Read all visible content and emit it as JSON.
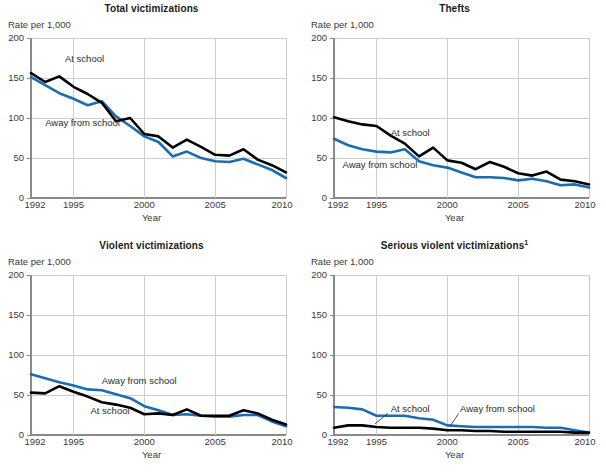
{
  "figure": {
    "axis_unit_label": "Rate per 1,000",
    "x_axis_label": "Year",
    "y_ticks": [
      "0",
      "50",
      "100",
      "150",
      "200"
    ],
    "x_ticks": [
      "1992",
      "1995",
      "2000",
      "2005",
      "2010"
    ],
    "series_label_at_school": "At school",
    "series_label_away": "Away from school",
    "colors": {
      "at_school": "#000000",
      "away_from_school": "#1b6cb0",
      "gridline": "#c9c9c9",
      "axis": "#8a8a8a",
      "text": "#3a3a3a"
    }
  },
  "chart_data": [
    {
      "type": "line",
      "title": "Total victimizations",
      "title_superscript": "",
      "xlabel": "Year",
      "ylabel": "Rate per 1,000",
      "xlim": [
        1992,
        2010
      ],
      "ylim": [
        0,
        200
      ],
      "yticks": [
        0,
        50,
        100,
        150,
        200
      ],
      "xticks": [
        1992,
        1995,
        2000,
        2005,
        2010
      ],
      "grid": true,
      "legend": "inline-labels",
      "x": [
        1992,
        1993,
        1994,
        1995,
        1996,
        1997,
        1998,
        1999,
        2000,
        2001,
        2002,
        2003,
        2004,
        2005,
        2006,
        2007,
        2008,
        2009,
        2010
      ],
      "series": [
        {
          "name": "At school",
          "color": "#000000",
          "values": [
            156,
            145,
            152,
            139,
            130,
            119,
            96,
            100,
            80,
            77,
            63,
            73,
            64,
            54,
            53,
            61,
            48,
            41,
            32
          ]
        },
        {
          "name": "Away from school",
          "color": "#1b6cb0",
          "values": [
            151,
            141,
            131,
            124,
            116,
            121,
            102,
            90,
            77,
            70,
            52,
            58,
            50,
            46,
            45,
            49,
            42,
            35,
            25
          ]
        }
      ],
      "labels": [
        {
          "text": "At school",
          "x": 1994.4,
          "y": 172
        },
        {
          "text": "Away from school",
          "x": 1993.0,
          "y": 93
        }
      ]
    },
    {
      "type": "line",
      "title": "Thefts",
      "title_superscript": "",
      "xlabel": "Year",
      "ylabel": "Rate per 1,000",
      "xlim": [
        1992,
        2010
      ],
      "ylim": [
        0,
        200
      ],
      "yticks": [
        0,
        50,
        100,
        150,
        200
      ],
      "xticks": [
        1992,
        1995,
        2000,
        2005,
        2010
      ],
      "grid": true,
      "legend": "inline-labels",
      "x": [
        1992,
        1993,
        1994,
        1995,
        1996,
        1997,
        1998,
        1999,
        2000,
        2001,
        2002,
        2003,
        2004,
        2005,
        2006,
        2007,
        2008,
        2009,
        2010
      ],
      "series": [
        {
          "name": "At school",
          "color": "#000000",
          "values": [
            101,
            96,
            92,
            90,
            78,
            68,
            52,
            63,
            47,
            44,
            36,
            45,
            39,
            31,
            28,
            33,
            23,
            21,
            17
          ]
        },
        {
          "name": "Away from school",
          "color": "#1b6cb0",
          "values": [
            74,
            66,
            61,
            58,
            57,
            61,
            46,
            41,
            38,
            32,
            26,
            26,
            25,
            22,
            24,
            21,
            16,
            17,
            13
          ]
        }
      ],
      "labels": [
        {
          "text": "At school",
          "x": 1996.0,
          "y": 80
        },
        {
          "text": "Away from school",
          "x": 1992.6,
          "y": 40
        }
      ]
    },
    {
      "type": "line",
      "title": "Violent victimizations",
      "title_superscript": "",
      "xlabel": "Year",
      "ylabel": "Rate per 1,000",
      "xlim": [
        1992,
        2010
      ],
      "ylim": [
        0,
        200
      ],
      "yticks": [
        0,
        50,
        100,
        150,
        200
      ],
      "xticks": [
        1992,
        1995,
        2000,
        2005,
        2010
      ],
      "grid": true,
      "legend": "inline-labels",
      "x": [
        1992,
        1993,
        1994,
        1995,
        1996,
        1997,
        1998,
        1999,
        2000,
        2001,
        2002,
        2003,
        2004,
        2005,
        2006,
        2007,
        2008,
        2009,
        2010
      ],
      "series": [
        {
          "name": "At school",
          "color": "#000000",
          "values": [
            53,
            52,
            61,
            54,
            48,
            41,
            38,
            34,
            26,
            27,
            25,
            32,
            24,
            24,
            24,
            31,
            27,
            19,
            13
          ]
        },
        {
          "name": "Away from school",
          "color": "#1b6cb0",
          "values": [
            76,
            71,
            66,
            62,
            57,
            56,
            51,
            46,
            36,
            31,
            25,
            26,
            24,
            23,
            23,
            25,
            25,
            17,
            11
          ]
        }
      ],
      "labels": [
        {
          "text": "Away from school",
          "x": 1997.0,
          "y": 66
        },
        {
          "text": "At school",
          "x": 1996.2,
          "y": 29
        }
      ]
    },
    {
      "type": "line",
      "title": "Serious violent victimizations",
      "title_superscript": "1",
      "xlabel": "Year",
      "ylabel": "Rate per 1,000",
      "xlim": [
        1992,
        2010
      ],
      "ylim": [
        0,
        200
      ],
      "yticks": [
        0,
        50,
        100,
        150,
        200
      ],
      "xticks": [
        1992,
        1995,
        2000,
        2005,
        2010
      ],
      "grid": true,
      "legend": "inline-labels",
      "x": [
        1992,
        1993,
        1994,
        1995,
        1996,
        1997,
        1998,
        1999,
        2000,
        2001,
        2002,
        2003,
        2004,
        2005,
        2006,
        2007,
        2008,
        2009,
        2010
      ],
      "series": [
        {
          "name": "At school",
          "color": "#000000",
          "values": [
            9,
            12,
            12,
            10,
            9,
            9,
            9,
            8,
            6,
            6,
            5,
            5,
            4,
            4,
            4,
            4,
            4,
            3,
            3
          ]
        },
        {
          "name": "Away from school",
          "color": "#1b6cb0",
          "values": [
            35,
            34,
            32,
            24,
            24,
            24,
            21,
            19,
            12,
            11,
            10,
            10,
            10,
            10,
            10,
            9,
            9,
            6,
            3
          ]
        }
      ],
      "labels": [
        {
          "text": "At school",
          "x": 1996.0,
          "y": 31
        },
        {
          "text": "Away from school",
          "x": 2000.9,
          "y": 31
        }
      ],
      "leader_lines": [
        {
          "from_label": "At school",
          "x1": 1995.8,
          "y1": 27,
          "x2": 1994.9,
          "y2": 14
        },
        {
          "from_label": "Away from school",
          "x1": 2000.8,
          "y1": 27,
          "x2": 2000.2,
          "y2": 11
        }
      ]
    }
  ]
}
